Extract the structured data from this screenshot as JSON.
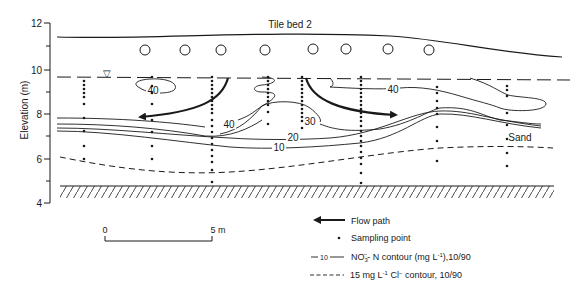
{
  "figure": {
    "title": "Tile bed 2",
    "y_axis": {
      "label": "Elevation (m)",
      "ticks": [
        "12",
        "10",
        "8",
        "6",
        "4"
      ]
    },
    "layer_label": "Sand",
    "water_table_symbol": "▽",
    "contour_labels": {
      "c40_left": "40",
      "c40_mid": "40",
      "c30": "30",
      "c20": "20",
      "c10": "10",
      "c40_right": "40"
    },
    "scale_bar": {
      "start": "0",
      "end": "5 m"
    }
  },
  "legend": {
    "items": [
      {
        "symbol": "arrow",
        "label": "Flow path"
      },
      {
        "symbol": "dot",
        "label": "Sampling point"
      },
      {
        "symbol": "solid-line",
        "sample": "10",
        "label_main": "NO",
        "label_sub": "3",
        "label_sup": "−",
        "label_rest": "- N contour (mg L",
        "label_exp": "-1",
        "label_end": "),10/90"
      },
      {
        "symbol": "dashed-line",
        "label_pre": "15 mg L",
        "label_exp": "-1",
        "label_mid": " Cl",
        "label_sup": "−",
        "label_end": " contour, 10/90"
      }
    ]
  },
  "colors": {
    "ink": "#1a1a1a",
    "background": "#ffffff"
  }
}
